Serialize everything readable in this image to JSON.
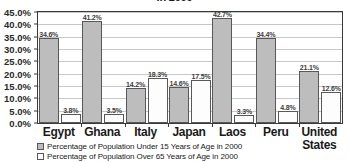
{
  "chart_data": {
    "type": "bar",
    "title": "in 2000",
    "xlabel": "",
    "ylabel": "",
    "ylim": [
      0,
      45
    ],
    "ytick_labels": [
      "0.0%",
      "5.0%",
      "10.0%",
      "15.0%",
      "20.0%",
      "25.0%",
      "30.0%",
      "35.0%",
      "40.0%",
      "45.0%"
    ],
    "ytick_values": [
      0,
      5,
      10,
      15,
      20,
      25,
      30,
      35,
      40,
      45
    ],
    "grid": true,
    "legend_position": "bottom-left",
    "categories": [
      "Egypt",
      "Ghana",
      "Italy",
      "Japan",
      "Laos",
      "Peru",
      "United\nStates"
    ],
    "series": [
      {
        "name": "Percentage of Population Under 15 Years of Age in 2000",
        "color": "#bdbdbd",
        "values": [
          34.6,
          41.2,
          14.2,
          14.6,
          42.7,
          34.4,
          21.1
        ],
        "labels": [
          "34.6%",
          "41.2%",
          "14.2%",
          "14.6%",
          "42.7%",
          "34.4%",
          "21.1%"
        ]
      },
      {
        "name": "Percentage of Population Over 65 Years of Age in 2000",
        "color": "#fdfdfd",
        "values": [
          3.8,
          3.5,
          18.3,
          17.5,
          3.3,
          4.8,
          12.6
        ],
        "labels": [
          "3.8%",
          "3.5%",
          "18.3%",
          "17.5%",
          "3.3%",
          "4.8%",
          "12.6%"
        ]
      }
    ]
  }
}
